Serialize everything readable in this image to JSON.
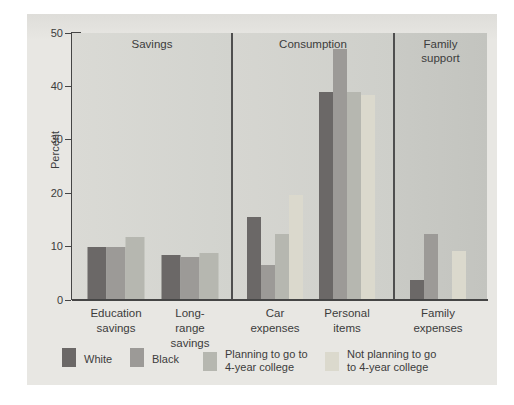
{
  "figure": {
    "background": "#e8e7e3",
    "axis_color": "#454545",
    "text_color": "#3c3c3c"
  },
  "chart_data": {
    "type": "bar",
    "title": "",
    "ylabel": "Percent",
    "xlabel": "",
    "ylim": [
      0,
      50
    ],
    "yticks": [
      0,
      10,
      20,
      30,
      40,
      50
    ],
    "grid": false,
    "legend_position": "bottom",
    "series": [
      {
        "key": "white",
        "name": "White",
        "color": "#6b6867"
      },
      {
        "key": "black",
        "name": "Black",
        "color": "#9c9a97"
      },
      {
        "key": "planning",
        "name": "Planning to go to\n4-year college",
        "color": "#b6b7b0"
      },
      {
        "key": "not-planning",
        "name": "Not planning to go\nto 4-year college",
        "color": "#dbd9cd"
      }
    ],
    "panels": [
      {
        "title": "Savings",
        "bg_left": "#dadad5",
        "bg_right": "#d2d3ce",
        "groups": [
          {
            "label": "Education\nsavings",
            "bars": [
              {
                "series_index": 0,
                "value": 10
              },
              {
                "series_index": 1,
                "value": 9.9
              },
              {
                "series_index": 2,
                "value": 11.8
              }
            ]
          },
          {
            "label": "Long-range\nsavings",
            "bars": [
              {
                "series_index": 0,
                "value": 8.5
              },
              {
                "series_index": 1,
                "value": 8.1
              },
              {
                "series_index": 2,
                "value": 8.8
              }
            ]
          }
        ]
      },
      {
        "title": "Consumption",
        "bg_left": "#d6d6d1",
        "bg_right": "#cecfca",
        "groups": [
          {
            "label": "Car\nexpenses",
            "bars": [
              {
                "series_index": 0,
                "value": 15.6
              },
              {
                "series_index": 1,
                "value": 6.6
              },
              {
                "series_index": 2,
                "value": 12.3
              },
              {
                "series_index": 3,
                "value": 19.7
              }
            ]
          },
          {
            "label": "Personal\nitems",
            "bars": [
              {
                "series_index": 0,
                "value": 39
              },
              {
                "series_index": 1,
                "value": 47
              },
              {
                "series_index": 2,
                "value": 39
              },
              {
                "series_index": 3,
                "value": 38.4
              }
            ]
          }
        ]
      },
      {
        "title": "Family\nsupport",
        "bg_left": "#c9cac5",
        "bg_right": "#c3c4bf",
        "groups": [
          {
            "label": "Family\nexpenses",
            "bars": [
              {
                "series_index": 0,
                "value": 3.7
              },
              {
                "series_index": 1,
                "value": 12.3
              },
              {
                "series_index": 2,
                "value": null
              },
              {
                "series_index": 3,
                "value": 9.1
              }
            ]
          }
        ]
      }
    ]
  }
}
